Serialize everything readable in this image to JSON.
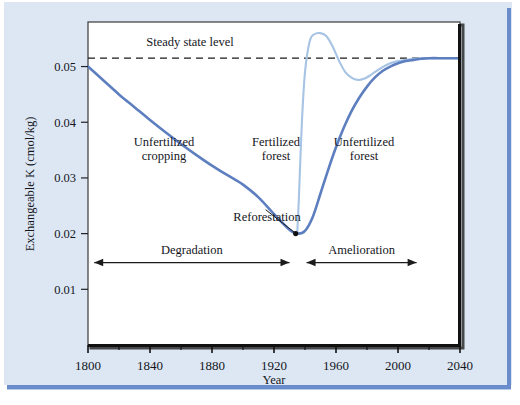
{
  "figure": {
    "background_color": "#dde7f4",
    "plot_background_color": "#ffffff",
    "main_curve_color": "#5d7fc0",
    "secondary_curve_color": "#a7c4e4",
    "axis_color": "#111111",
    "rule_color": "#6a8ccb"
  },
  "chart_data": {
    "type": "line",
    "title": "",
    "xlabel": "Year",
    "ylabel": "Exchangeable K (cmol/kg)",
    "xlim": [
      1800,
      2040
    ],
    "ylim": [
      0.0,
      0.058
    ],
    "grid": false,
    "legend": "none",
    "xticks": [
      1800,
      1840,
      1880,
      1920,
      1960,
      2000,
      2040
    ],
    "xtick_labels": [
      "1800",
      "1840",
      "1880",
      "1920",
      "1960",
      "2000",
      "2040"
    ],
    "xminor_ticks": [
      1820,
      1860,
      1900,
      1940,
      1980,
      2020
    ],
    "yticks": [
      0.01,
      0.02,
      0.03,
      0.04,
      0.05
    ],
    "ytick_labels": [
      "0.01",
      "0.02",
      "0.03",
      "0.04",
      "0.05"
    ],
    "steady_state_level": 0.0515,
    "series": [
      {
        "name": "Unfertilized cropping then unfertilized forest",
        "color": "#5d7fc0",
        "style": "solid",
        "x": [
          1800,
          1810,
          1820,
          1830,
          1840,
          1850,
          1860,
          1870,
          1880,
          1890,
          1900,
          1910,
          1920,
          1930,
          1935,
          1940,
          1945,
          1950,
          1955,
          1960,
          1965,
          1970,
          1975,
          1980,
          1985,
          1990,
          1995,
          2000,
          2005,
          2010,
          2015,
          2020,
          2030,
          2040
        ],
        "y": [
          0.05,
          0.0475,
          0.045,
          0.0427,
          0.0404,
          0.0382,
          0.0361,
          0.0341,
          0.0322,
          0.0305,
          0.0288,
          0.0265,
          0.0235,
          0.0207,
          0.02,
          0.0205,
          0.023,
          0.0272,
          0.0315,
          0.0355,
          0.039,
          0.042,
          0.0444,
          0.0464,
          0.048,
          0.0492,
          0.05,
          0.0506,
          0.051,
          0.0512,
          0.0514,
          0.0515,
          0.0515,
          0.0515
        ]
      },
      {
        "name": "Fertilized forest",
        "color": "#a7c4e4",
        "style": "solid",
        "x": [
          1935,
          1936,
          1938,
          1940,
          1943,
          1946,
          1950,
          1954,
          1958,
          1962,
          1966,
          1970,
          1974,
          1978,
          1982,
          1986,
          1990,
          1995,
          2000,
          2010,
          2020,
          2030,
          2040
        ],
        "y": [
          0.02,
          0.026,
          0.04,
          0.049,
          0.0545,
          0.0558,
          0.056,
          0.0554,
          0.0535,
          0.051,
          0.049,
          0.048,
          0.0476,
          0.0478,
          0.0484,
          0.0492,
          0.0499,
          0.0506,
          0.051,
          0.0514,
          0.0515,
          0.0515,
          0.0515
        ]
      }
    ],
    "annotations": [
      {
        "name": "steady-state-level",
        "text": "Steady state level",
        "x": 1868,
        "y": 0.0545
      },
      {
        "name": "unfertilized-cropping",
        "text": "Unfertilized\ncropping",
        "lines": [
          "Unfertilized",
          "cropping"
        ],
        "x": 1853,
        "y": 0.0378
      },
      {
        "name": "fertilized-forest",
        "text": "Fertilized\nforest",
        "lines": [
          "Fertilized",
          "forest"
        ],
        "x": 1932,
        "y": 0.0378
      },
      {
        "name": "unfertilized-forest",
        "text": "Unfertilized\nforest",
        "lines": [
          "Unfertilized",
          "forest"
        ],
        "x": 1989,
        "y": 0.0378
      },
      {
        "name": "reforestation",
        "text": "Reforestation",
        "x": 1912,
        "y": 0.0252,
        "point_x": 1934,
        "point_y": 0.02
      }
    ],
    "range_markers": [
      {
        "name": "degradation",
        "label": "Degradation",
        "from": 1804,
        "to": 1930,
        "y": 0.0148
      },
      {
        "name": "amelioration",
        "label": "Amelioration",
        "from": 1941,
        "to": 2012,
        "y": 0.0148
      }
    ]
  }
}
